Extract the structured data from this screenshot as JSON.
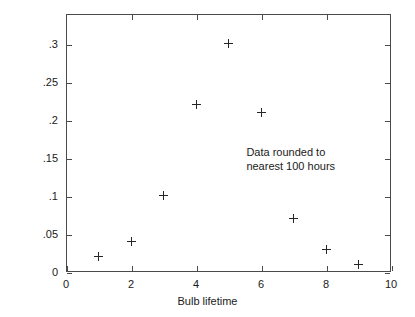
{
  "chart_data": {
    "type": "scatter",
    "title": "",
    "xlabel": "Bulb lifetime",
    "ylabel": "Probability",
    "xlim": [
      0,
      10
    ],
    "ylim": [
      0,
      0.3389
    ],
    "grid": false,
    "legend": "none",
    "marker": "plus",
    "x": [
      1,
      2,
      3,
      4,
      5,
      6,
      7,
      8,
      9
    ],
    "values": [
      0.02,
      0.04,
      0.1,
      0.22,
      0.3,
      0.21,
      0.07,
      0.03,
      0.01
    ],
    "points": [
      {
        "x": 1,
        "y": 0.02
      },
      {
        "x": 2,
        "y": 0.04
      },
      {
        "x": 3,
        "y": 0.1
      },
      {
        "x": 4,
        "y": 0.22
      },
      {
        "x": 5,
        "y": 0.3
      },
      {
        "x": 6,
        "y": 0.21
      },
      {
        "x": 7,
        "y": 0.07
      },
      {
        "x": 8,
        "y": 0.03
      },
      {
        "x": 9,
        "y": 0.01
      }
    ],
    "xticks": [
      {
        "value": 0,
        "label": "0"
      },
      {
        "value": 2,
        "label": "2"
      },
      {
        "value": 4,
        "label": "4"
      },
      {
        "value": 6,
        "label": "6"
      },
      {
        "value": 8,
        "label": "8"
      },
      {
        "value": 10,
        "label": "10"
      }
    ],
    "yticks": [
      {
        "value": 0,
        "label": "0"
      },
      {
        "value": 0.05,
        "label": ".05"
      },
      {
        "value": 0.1,
        "label": ".1"
      },
      {
        "value": 0.15,
        "label": ".15"
      },
      {
        "value": 0.2,
        "label": ".2"
      },
      {
        "value": 0.25,
        "label": ".25"
      },
      {
        "value": 0.3,
        "label": ".3"
      }
    ],
    "annotations": [
      {
        "text": "Data rounded to\nnearest 100 hours",
        "x": 5.55,
        "y": 0.158
      }
    ],
    "colors": {
      "background": "#ffffff",
      "axis": "#4a4a4a",
      "text": "#1a1a1a",
      "marker": "#262626"
    }
  }
}
